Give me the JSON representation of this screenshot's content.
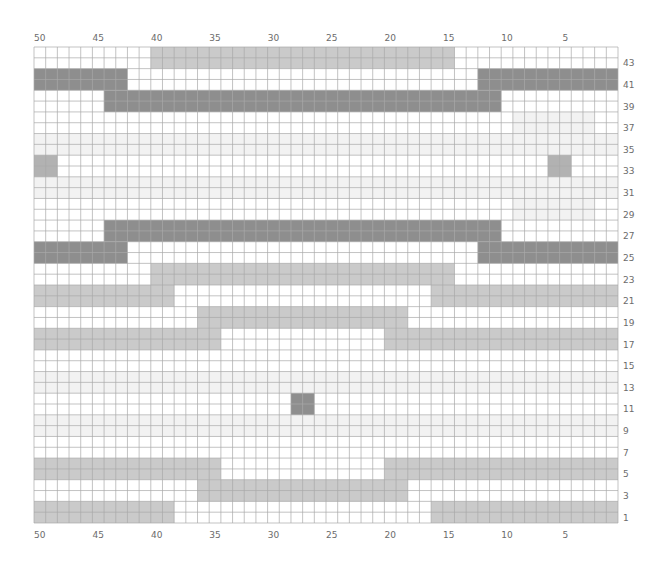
{
  "chart": {
    "columns": 50,
    "rows": 44,
    "column_labels": [
      50,
      45,
      40,
      35,
      30,
      25,
      20,
      15,
      10,
      5
    ],
    "row_labels": [
      43,
      41,
      39,
      37,
      35,
      33,
      31,
      29,
      27,
      25,
      23,
      21,
      19,
      17,
      15,
      13,
      11,
      9,
      7,
      5,
      3,
      1
    ],
    "colors": {
      "background": "#ffffff",
      "grid_line": "#a9a9a9",
      "dark": "#8e8e8e",
      "medium": "#b2b2b2",
      "light": "#cacaca",
      "faint": "#f2f2f2",
      "label": "#6b6b6b"
    }
  },
  "chart_data": {
    "type": "heatmap",
    "title": "",
    "xlabel": "Stitch (numbered right to left)",
    "ylabel": "Row (numbered bottom to top)",
    "x_range": [
      1,
      50
    ],
    "y_range": [
      1,
      44
    ],
    "legend": [
      {
        "key": "dark",
        "meaning": "dark gray color"
      },
      {
        "key": "medium",
        "meaning": "medium gray color"
      },
      {
        "key": "light",
        "meaning": "light gray color"
      },
      {
        "key": "faint",
        "meaning": "very faint shading"
      },
      {
        "key": "white",
        "meaning": "background / main color"
      }
    ],
    "runs": [
      {
        "rows": [
          43,
          44
        ],
        "cols": [
          15,
          40
        ],
        "color": "light"
      },
      {
        "rows": [
          41,
          42
        ],
        "cols": [
          43,
          50
        ],
        "color": "dark"
      },
      {
        "rows": [
          41,
          42
        ],
        "cols": [
          1,
          12
        ],
        "color": "dark"
      },
      {
        "rows": [
          39,
          40
        ],
        "cols": [
          11,
          44
        ],
        "color": "dark"
      },
      {
        "rows": [
          37,
          38
        ],
        "cols": [
          3,
          9
        ],
        "color": "faint"
      },
      {
        "rows": [
          35,
          36
        ],
        "cols": [
          1,
          50
        ],
        "color": "faint"
      },
      {
        "rows": [
          33,
          34
        ],
        "cols": [
          49,
          50
        ],
        "color": "medium"
      },
      {
        "rows": [
          33,
          34
        ],
        "cols": [
          5,
          6
        ],
        "color": "medium"
      },
      {
        "rows": [
          31,
          32
        ],
        "cols": [
          1,
          50
        ],
        "color": "faint"
      },
      {
        "rows": [
          29,
          30
        ],
        "cols": [
          3,
          9
        ],
        "color": "faint"
      },
      {
        "rows": [
          27,
          28
        ],
        "cols": [
          11,
          44
        ],
        "color": "dark"
      },
      {
        "rows": [
          25,
          26
        ],
        "cols": [
          43,
          50
        ],
        "color": "dark"
      },
      {
        "rows": [
          25,
          26
        ],
        "cols": [
          1,
          12
        ],
        "color": "dark"
      },
      {
        "rows": [
          23,
          24
        ],
        "cols": [
          15,
          40
        ],
        "color": "light"
      },
      {
        "rows": [
          21,
          22
        ],
        "cols": [
          39,
          50
        ],
        "color": "light"
      },
      {
        "rows": [
          21,
          22
        ],
        "cols": [
          1,
          16
        ],
        "color": "light"
      },
      {
        "rows": [
          19,
          20
        ],
        "cols": [
          19,
          36
        ],
        "color": "light"
      },
      {
        "rows": [
          17,
          18
        ],
        "cols": [
          35,
          50
        ],
        "color": "light"
      },
      {
        "rows": [
          17,
          18
        ],
        "cols": [
          1,
          20
        ],
        "color": "light"
      },
      {
        "rows": [
          13,
          14
        ],
        "cols": [
          1,
          50
        ],
        "color": "faint"
      },
      {
        "rows": [
          11,
          12
        ],
        "cols": [
          27,
          28
        ],
        "color": "dark"
      },
      {
        "rows": [
          9,
          10
        ],
        "cols": [
          1,
          50
        ],
        "color": "faint"
      },
      {
        "rows": [
          5,
          6
        ],
        "cols": [
          35,
          50
        ],
        "color": "light"
      },
      {
        "rows": [
          5,
          6
        ],
        "cols": [
          1,
          20
        ],
        "color": "light"
      },
      {
        "rows": [
          3,
          4
        ],
        "cols": [
          19,
          36
        ],
        "color": "light"
      },
      {
        "rows": [
          1,
          2
        ],
        "cols": [
          39,
          50
        ],
        "color": "light"
      },
      {
        "rows": [
          1,
          2
        ],
        "cols": [
          1,
          16
        ],
        "color": "light"
      }
    ]
  }
}
